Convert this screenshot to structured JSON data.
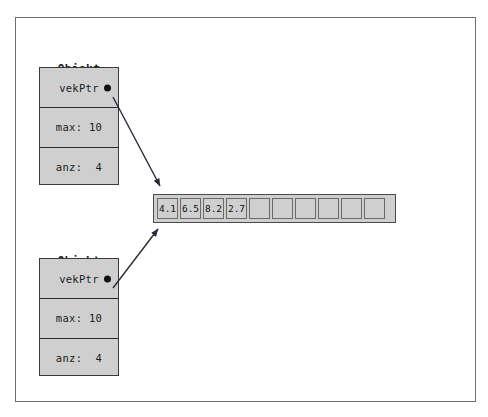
{
  "diagram": {
    "title_hidden": "",
    "objects": [
      {
        "label_line1": "Objekt",
        "label_line2": "a",
        "rows": [
          {
            "text": "vekPtr",
            "has_pointer_dot": true
          },
          {
            "text": "max: 10",
            "has_pointer_dot": false
          },
          {
            "text": "anz:  4",
            "has_pointer_dot": false
          }
        ]
      },
      {
        "label_line1": "Objekt",
        "label_line2": "b",
        "rows": [
          {
            "text": "vekPtr",
            "has_pointer_dot": true
          },
          {
            "text": "max: 10",
            "has_pointer_dot": false
          },
          {
            "text": "anz:  4",
            "has_pointer_dot": false
          }
        ]
      }
    ],
    "array": {
      "capacity": 10,
      "used": 4,
      "cells": [
        "4.1",
        "6.5",
        "8.2",
        "2.7",
        "",
        "",
        "",
        "",
        "",
        ""
      ]
    },
    "arrows": [
      {
        "from": "objekt-a-vekptr",
        "to": "array"
      },
      {
        "from": "objekt-b-vekptr",
        "to": "array"
      }
    ],
    "colors": {
      "box_fill": "#cfcfcf",
      "box_border": "#3a3a3a",
      "frame_border": "#6e6e6e",
      "text": "#1b1b1b",
      "arrow": "#2a2a3a",
      "background": "#ffffff"
    }
  }
}
